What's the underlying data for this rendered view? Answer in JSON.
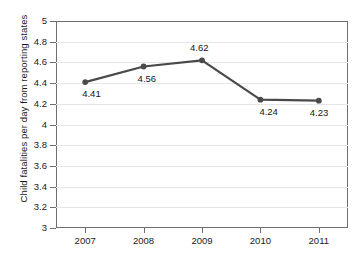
{
  "chart_data": {
    "type": "line",
    "title": "",
    "xlabel": "",
    "ylabel": "Child fatalities per day from reporting states",
    "categories": [
      "2007",
      "2008",
      "2009",
      "2010",
      "2011"
    ],
    "values": [
      4.41,
      4.56,
      4.62,
      4.24,
      4.23
    ],
    "point_labels": [
      "4.41",
      "4.56",
      "4.62",
      "4.24",
      "4.23"
    ],
    "ylim": [
      3,
      5
    ],
    "ytick_labels": [
      "3",
      "3.2",
      "3.4",
      "3.6",
      "3.8",
      "4",
      "4.2",
      "4.4",
      "4.6",
      "4.8",
      "5"
    ],
    "ytick_values": [
      3,
      3.2,
      3.4,
      3.6,
      3.8,
      4,
      4.2,
      4.4,
      4.6,
      4.8,
      5
    ],
    "xtick_labels": [
      "2007",
      "2008",
      "2009",
      "2010",
      "2011"
    ],
    "grid": true,
    "legend": "none",
    "series_color": "#4a4a4a",
    "grid_color": "#e6e6e8",
    "axis_color": "#6e6e72",
    "background_color": "#ffffff",
    "marker": "circle"
  }
}
